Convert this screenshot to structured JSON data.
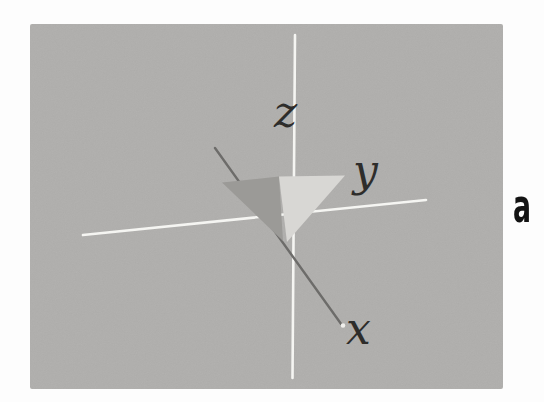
{
  "figure": {
    "labels": {
      "z": "z",
      "y": "y",
      "x": "x"
    },
    "caption": {
      "label": "a",
      "color": "#131313"
    },
    "colors": {
      "photo_background": "#b0afad",
      "axis_white": "#f5f5f2",
      "x_axis_dark": "#6d6c6a",
      "cone_dark_face": "#9b9a97",
      "cone_light_face": "#d8d7d4",
      "axis_label": "#2e2d2b",
      "x_axis_end_dot": "#f0efec"
    }
  }
}
